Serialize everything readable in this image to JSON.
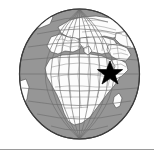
{
  "figure": {
    "name": "world-globe-locator-map",
    "title": "Orthographic globe locator map",
    "description": "Shaded globe centred on Africa and Europe with a black star marking a location in East Africa",
    "caption": ""
  },
  "map": {
    "projection": "orthographic",
    "center_longitude": 20,
    "center_latitude": 10,
    "ocean_color": "#969696",
    "land_color": "#fcfcfc",
    "border_color": "#8a8a8a",
    "coastline_color": "#4a4a4a",
    "graticule_color": "#6e6e6e",
    "outline_color": "#3c3c3c",
    "graticule_spacing_degrees": 15,
    "regions_visible": [
      "Europe",
      "Africa",
      "Middle East",
      "Western Asia",
      "Atlantic Ocean",
      "Indian Ocean"
    ]
  },
  "marker": {
    "type": "star",
    "label": "location-star",
    "color": "#000000",
    "points": 5,
    "approx_longitude": 42,
    "approx_latitude": 8,
    "region": "East Africa"
  },
  "divider": {
    "label": "horizontal-rule",
    "color": "#9a9a9a"
  }
}
